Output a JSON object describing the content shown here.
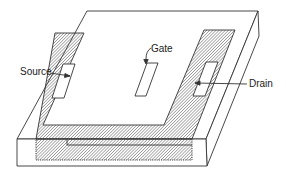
{
  "figure": {
    "labels": {
      "source": "Source",
      "gate": "Gate",
      "drain": "Drain"
    },
    "colors": {
      "line": "#333333",
      "hatch": "#555555",
      "background": "#ffffff"
    }
  }
}
